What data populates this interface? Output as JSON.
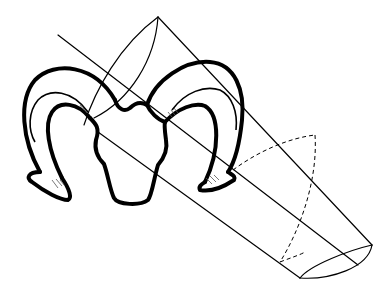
{
  "figure": {
    "colors": {
      "stroke": "#000000",
      "background": "#ffffff"
    },
    "elements": [
      "ram-head",
      "left-horn",
      "right-horn",
      "cylinder",
      "cylinder-axis",
      "hidden-cross-section"
    ]
  }
}
